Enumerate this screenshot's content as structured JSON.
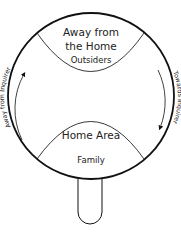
{
  "diagram": {
    "top_region": {
      "title_line1": "Away from",
      "title_line2": "the Home",
      "subtitle": "Outsiders"
    },
    "bottom_region": {
      "title": "Home Area",
      "subtitle": "Family"
    },
    "left_arrow": {
      "label": "Away from Inquirer",
      "direction": "up"
    },
    "right_arrow": {
      "label": "Towards Inquirer",
      "direction": "down"
    },
    "colors": {
      "stroke": "#111111",
      "text": "#222222",
      "background": "#ffffff"
    }
  }
}
